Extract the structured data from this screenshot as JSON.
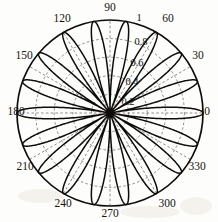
{
  "chart_data": {
    "type": "line",
    "plot_style": "polar",
    "title": "",
    "xlabel": "",
    "ylabel": "",
    "angular_axis": {
      "unit": "degrees",
      "tick_labels": [
        "0",
        "30",
        "60",
        "90",
        "120",
        "150",
        "180",
        "210",
        "240",
        "270",
        "300",
        "330"
      ],
      "tick_values": [
        0,
        30,
        60,
        90,
        120,
        150,
        180,
        210,
        240,
        270,
        300,
        330
      ],
      "direction": "counterclockwise",
      "zero_location": "east",
      "grid": true
    },
    "radial_axis": {
      "tick_labels": [
        "0.2",
        "0.4",
        "0.6",
        "0.8",
        "1"
      ],
      "tick_values": [
        0.2,
        0.4,
        0.6,
        0.8,
        1
      ],
      "rlim": [
        0,
        1
      ],
      "label_angle_deg": 75,
      "grid": true
    },
    "series": [
      {
        "name": "rose",
        "equation": "r = |cos(9*theta)|",
        "petals": 18,
        "petal_angular_width_deg": 20,
        "petal_peak_angles_deg": [
          0,
          20,
          40,
          60,
          80,
          100,
          120,
          140,
          160,
          180,
          200,
          220,
          240,
          260,
          280,
          300,
          320,
          340
        ],
        "peak_radius": 1.0,
        "min_radius": 0.0
      }
    ],
    "legend": null,
    "legend_position": "none",
    "colors": {
      "curve": "#0d0c0a",
      "outer_circle": "#0d0c0a",
      "grid": "#5d5d5d",
      "background": "#fdfdfb",
      "text": "#15130f"
    }
  },
  "angular_labels": [
    {
      "text": "0",
      "x": 207,
      "y": 115,
      "anchor": "middle"
    },
    {
      "text": "30",
      "x": 198,
      "y": 59,
      "anchor": "middle"
    },
    {
      "text": "60",
      "x": 168,
      "y": 22,
      "anchor": "middle"
    },
    {
      "text": "90",
      "x": 110,
      "y": 11,
      "anchor": "middle"
    },
    {
      "text": "120",
      "x": 62,
      "y": 22,
      "anchor": "middle"
    },
    {
      "text": "150",
      "x": 24,
      "y": 59,
      "anchor": "middle"
    },
    {
      "text": "180",
      "x": 16,
      "y": 115,
      "anchor": "middle"
    },
    {
      "text": "210",
      "x": 25,
      "y": 170,
      "anchor": "middle"
    },
    {
      "text": "240",
      "x": 63,
      "y": 207,
      "anchor": "middle"
    },
    {
      "text": "270",
      "x": 110,
      "y": 217,
      "anchor": "middle"
    },
    {
      "text": "300",
      "x": 167,
      "y": 207,
      "anchor": "middle"
    },
    {
      "text": "330",
      "x": 197,
      "y": 170,
      "anchor": "middle"
    }
  ],
  "radial_labels": [
    {
      "text": "1",
      "x": 139,
      "y": 21
    },
    {
      "text": "0.8",
      "x": 141,
      "y": 45
    },
    {
      "text": "0.6",
      "x": 137,
      "y": 66
    },
    {
      "text": "0.4",
      "x": 132,
      "y": 85
    },
    {
      "text": "0.2",
      "x": 128,
      "y": 105
    }
  ]
}
